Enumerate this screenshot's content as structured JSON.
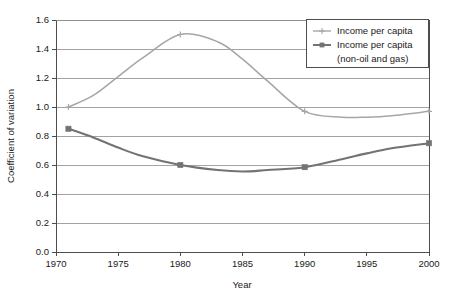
{
  "chart_data": {
    "type": "line",
    "title": "",
    "xlabel": "Year",
    "ylabel": "Coefficient of variation",
    "xlim": [
      1970,
      2000
    ],
    "ylim": [
      0.0,
      1.6
    ],
    "xticks": [
      1970,
      1975,
      1980,
      1985,
      1990,
      1995,
      2000
    ],
    "xtick_labels": [
      "1970",
      "1975",
      "1980",
      "1985",
      "1990",
      "1995",
      "2000"
    ],
    "yticks": [
      0.0,
      0.2,
      0.4,
      0.6,
      0.8,
      1.0,
      1.2,
      1.4,
      1.6
    ],
    "ytick_labels": [
      "0.0",
      "0.2",
      "0.4",
      "0.6",
      "0.8",
      "1.0",
      "1.2",
      "1.4",
      "1.6"
    ],
    "grid": "horizontal",
    "legend_position": "top-right",
    "series": [
      {
        "name": "Income per capita",
        "marker": "cross",
        "color": "#a6a6a6",
        "x": [
          1971,
          1980,
          1990,
          2000
        ],
        "values": [
          1.0,
          1.5,
          0.97,
          0.97
        ],
        "smoothed_x": [
          1971,
          1973,
          1975,
          1977,
          1980,
          1983,
          1985,
          1987,
          1990,
          1993,
          1995,
          1997,
          2000
        ],
        "smoothed_values": [
          1.0,
          1.08,
          1.21,
          1.34,
          1.5,
          1.45,
          1.33,
          1.18,
          0.97,
          0.93,
          0.93,
          0.94,
          0.97
        ]
      },
      {
        "name": "Income per capita (non-oil and gas)",
        "legend_line_1": "Income per capita",
        "legend_line_2": "(non-oil and gas)",
        "marker": "square",
        "color": "#737373",
        "x": [
          1971,
          1980,
          1990,
          2000
        ],
        "values": [
          0.85,
          0.6,
          0.585,
          0.75
        ],
        "smoothed_x": [
          1971,
          1973,
          1975,
          1977,
          1980,
          1983,
          1985,
          1987,
          1990,
          1993,
          1995,
          1997,
          2000
        ],
        "smoothed_values": [
          0.85,
          0.79,
          0.72,
          0.66,
          0.6,
          0.565,
          0.555,
          0.565,
          0.585,
          0.64,
          0.68,
          0.715,
          0.75
        ]
      }
    ]
  },
  "legend": {
    "entries": [
      {
        "label": "Income per capita",
        "label_2": ""
      },
      {
        "label": "Income per capita",
        "label_2": "(non-oil and gas)"
      }
    ]
  },
  "colors": {
    "series_light": "#a6a6a6",
    "series_dark": "#737373",
    "axis": "#4d4d4d",
    "grid": "#8c8c8c",
    "text": "#1a1a1a",
    "background": "#ffffff"
  }
}
